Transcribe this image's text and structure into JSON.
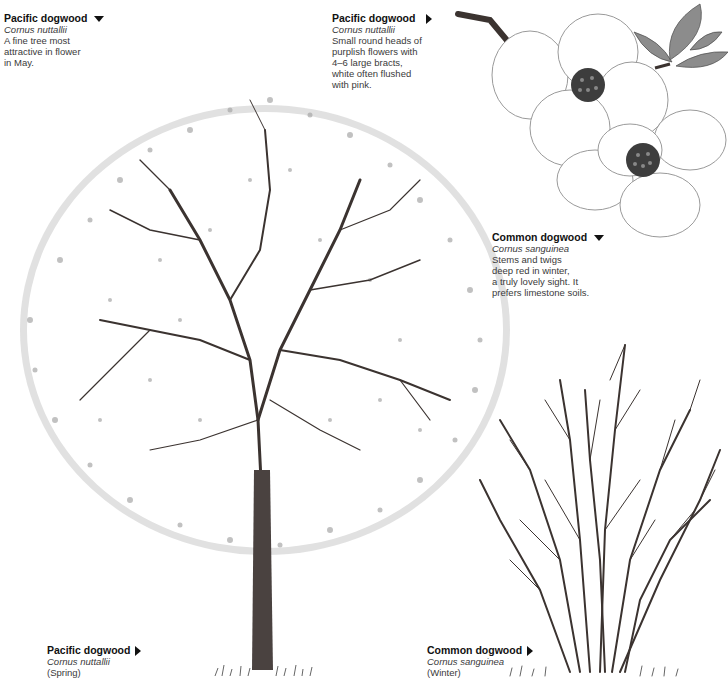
{
  "captions": {
    "pacific_top_left": {
      "title": "Pacific dogwood",
      "arrow": "down",
      "latin": "Cornus nuttallii",
      "desc": [
        "A fine tree most",
        "attractive in flower",
        "in May."
      ]
    },
    "pacific_flower": {
      "title": "Pacific dogwood",
      "arrow": "right",
      "latin": "Cornus nuttallii",
      "desc": [
        "Small round heads of",
        "purplish flowers with",
        "4–6 large bracts,",
        "white often flushed",
        "with pink."
      ]
    },
    "common_desc": {
      "title": "Common dogwood",
      "arrow": "down",
      "latin": "Cornus sanguinea",
      "desc": [
        "Stems and twigs",
        "deep red in winter,",
        "a truly lovely sight. It",
        "prefers limestone soils."
      ]
    },
    "pacific_spring": {
      "title": "Pacific dogwood",
      "arrow": "right",
      "latin": "Cornus nuttallii",
      "season": "(Spring)"
    },
    "common_winter": {
      "title": "Common dogwood",
      "arrow": "right",
      "latin": "Cornus sanguinea",
      "season": "(Winter)"
    }
  },
  "illustrations": {
    "tree": "Pacific dogwood tree in spring bloom",
    "flower": "Pacific dogwood flower heads with bracts and leaves",
    "shrub": "Common dogwood shrub bare stems in winter"
  },
  "colors": {
    "ink": "#111111",
    "text": "#3a3a3a",
    "branch": "#3b3330",
    "blossom": "#9a9a9a"
  }
}
